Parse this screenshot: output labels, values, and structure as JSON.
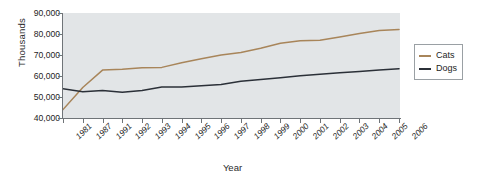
{
  "chart_data": {
    "type": "line",
    "title": "",
    "xlabel": "Year",
    "ylabel": "Thousands",
    "ylim": [
      40000,
      90000
    ],
    "ytick_values": [
      40000,
      50000,
      60000,
      70000,
      80000,
      90000
    ],
    "ytick_labels": [
      "40,000",
      "50,000",
      "60,000",
      "70,000",
      "80,000",
      "90,000"
    ],
    "categories": [
      "1981",
      "1987",
      "1991",
      "1992",
      "1993",
      "1994",
      "1995",
      "1996",
      "1997",
      "1998",
      "1999",
      "2000",
      "2001",
      "2002",
      "2003",
      "2004",
      "2005",
      "2006"
    ],
    "grid": false,
    "legend_position": "right",
    "plot_background": "#e2e5e7",
    "axis_color": "#6f7478",
    "series": [
      {
        "name": "Cats",
        "color": "#a8855a",
        "values": [
          44000,
          54500,
          62800,
          63200,
          63900,
          64100,
          66300,
          68200,
          70000,
          71200,
          73200,
          75600,
          76800,
          77000,
          78600,
          80200,
          81700,
          82200
        ]
      },
      {
        "name": "Dogs",
        "color": "#2b3038",
        "values": [
          53900,
          52500,
          53100,
          52300,
          53100,
          54800,
          54800,
          55400,
          55900,
          57500,
          58300,
          59200,
          60100,
          60800,
          61500,
          62200,
          62900,
          63500
        ]
      }
    ]
  },
  "legend": {
    "items": [
      {
        "label": "Cats",
        "color": "#a8855a"
      },
      {
        "label": "Dogs",
        "color": "#2b3038"
      }
    ]
  }
}
